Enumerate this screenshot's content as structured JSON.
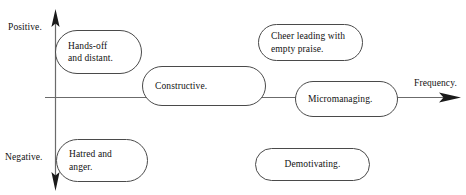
{
  "diagram": {
    "axes": {
      "vertical": {
        "top_label": "Positive.",
        "bottom_label": "Negative.",
        "arrow_both_ends": true
      },
      "horizontal": {
        "label": "Frequency.",
        "arrow_right": true
      }
    },
    "nodes": [
      {
        "id": "hands-off",
        "label": "Hands-off\nand distant.",
        "line1": "Hands-off",
        "line2": "and distant."
      },
      {
        "id": "constructive",
        "label": "Constructive.",
        "line1": "Constructive.",
        "line2": ""
      },
      {
        "id": "cheer-leading",
        "label": "Cheer leading with\nempty praise.",
        "line1": "Cheer leading with",
        "line2": "empty praise."
      },
      {
        "id": "micromanaging",
        "label": "Micromanaging.",
        "line1": "Micromanaging.",
        "line2": ""
      },
      {
        "id": "hatred-anger",
        "label": "Hatred and\nanger.",
        "line1": "Hatred and",
        "line2": "anger."
      },
      {
        "id": "demotivating",
        "label": "Demotivating.",
        "line1": "Demotivating.",
        "line2": ""
      }
    ],
    "colors": {
      "background": "#ffffff",
      "axis_line": "#6b6b6b",
      "arrow_fill": "#1a1a1a",
      "node_border": "#4a4a4a",
      "node_fill": "#ffffff",
      "text": "#111111"
    }
  }
}
